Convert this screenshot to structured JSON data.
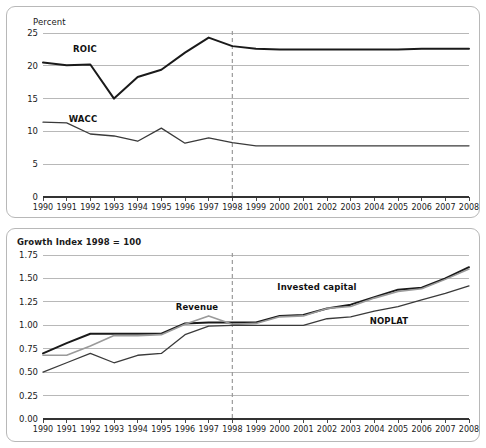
{
  "chart_data": [
    {
      "type": "line",
      "title": "",
      "ylabel": "Percent",
      "xlabel": "",
      "ylim": [
        0,
        25
      ],
      "yticks": [
        "0",
        "5",
        "10",
        "15",
        "20",
        "25"
      ],
      "grid": true,
      "legend_position": "inline-labels",
      "x": [
        "1990",
        "1991",
        "1992",
        "1993",
        "1994",
        "1995",
        "1996",
        "1997",
        "1998",
        "1999",
        "2000",
        "2001",
        "2002",
        "2003",
        "2004",
        "2005",
        "2006",
        "2007",
        "2008"
      ],
      "annotations": [
        {
          "text": "forecast-divider",
          "x": "1998",
          "style": "dashed-vertical"
        }
      ],
      "series": [
        {
          "name": "ROIC",
          "color": "#1a1a1a",
          "width": 2.0,
          "values": [
            20.5,
            20.1,
            20.2,
            15.0,
            18.3,
            19.4,
            22.0,
            24.3,
            23.0,
            22.6,
            22.5,
            22.5,
            22.5,
            22.5,
            22.5,
            22.5,
            22.6,
            22.6,
            22.6
          ]
        },
        {
          "name": "WACC",
          "color": "#3a3a3a",
          "width": 1.3,
          "values": [
            11.4,
            11.3,
            9.6,
            9.3,
            8.5,
            10.5,
            8.2,
            9.0,
            8.3,
            7.8,
            7.8,
            7.8,
            7.8,
            7.8,
            7.8,
            7.8,
            7.8,
            7.8,
            7.8
          ]
        }
      ]
    },
    {
      "type": "line",
      "title": "Growth Index 1998 = 100",
      "ylabel": "",
      "xlabel": "",
      "ylim": [
        0,
        1.75
      ],
      "yticks": [
        "0.00",
        "0.25",
        "0.50",
        "0.75",
        "1.00",
        "1.25",
        "1.50",
        "1.75"
      ],
      "grid": true,
      "legend_position": "inline-labels",
      "x": [
        "1990",
        "1991",
        "1992",
        "1993",
        "1994",
        "1995",
        "1996",
        "1997",
        "1998",
        "1999",
        "2000",
        "2001",
        "2002",
        "2003",
        "2004",
        "2005",
        "2006",
        "2007",
        "2008"
      ],
      "annotations": [
        {
          "text": "forecast-divider",
          "x": "1998",
          "style": "dashed-vertical"
        }
      ],
      "series": [
        {
          "name": "Invested capital",
          "color": "#1a1a1a",
          "width": 2.0,
          "values": [
            0.7,
            0.81,
            0.91,
            0.91,
            0.91,
            0.91,
            1.02,
            1.03,
            1.03,
            1.03,
            1.1,
            1.11,
            1.18,
            1.22,
            1.3,
            1.38,
            1.4,
            1.5,
            1.62
          ]
        },
        {
          "name": "Revenue",
          "color": "#9a9a9a",
          "width": 1.6,
          "values": [
            0.68,
            0.68,
            0.78,
            0.89,
            0.89,
            0.9,
            1.01,
            1.1,
            1.01,
            1.02,
            1.09,
            1.1,
            1.18,
            1.2,
            1.29,
            1.36,
            1.39,
            1.49,
            1.6
          ]
        },
        {
          "name": "NOPLAT",
          "color": "#3a3a3a",
          "width": 1.3,
          "values": [
            0.5,
            0.6,
            0.7,
            0.6,
            0.68,
            0.7,
            0.9,
            0.99,
            1.0,
            1.0,
            1.0,
            1.0,
            1.07,
            1.09,
            1.15,
            1.2,
            1.27,
            1.34,
            1.42
          ]
        }
      ]
    }
  ],
  "panels": {
    "top": {
      "axis_title": "Percent",
      "yticks": [
        "25",
        "20",
        "15",
        "10",
        "5",
        "0"
      ],
      "xticks": [
        "1990",
        "1991",
        "1992",
        "1993",
        "1994",
        "1995",
        "1996",
        "1997",
        "1998",
        "1999",
        "2000",
        "2001",
        "2002",
        "2003",
        "2004",
        "2005",
        "2006",
        "2007",
        "2008"
      ],
      "labels": [
        {
          "name": "roic",
          "text": "ROIC"
        },
        {
          "name": "wacc",
          "text": "WACC"
        }
      ]
    },
    "bottom": {
      "axis_title": "Growth Index 1998 = 100",
      "yticks": [
        "1.75",
        "1.50",
        "1.25",
        "1.00",
        "0.75",
        "0.50",
        "0.25",
        "0.00"
      ],
      "xticks": [
        "1990",
        "1991",
        "1992",
        "1993",
        "1994",
        "1995",
        "1996",
        "1997",
        "1998",
        "1999",
        "2000",
        "2001",
        "2002",
        "2003",
        "2004",
        "2005",
        "2006",
        "2007",
        "2008"
      ],
      "labels": [
        {
          "name": "revenue",
          "text": "Revenue"
        },
        {
          "name": "invested-capital",
          "text": "Invested capital"
        },
        {
          "name": "noplat",
          "text": "NOPLAT"
        }
      ]
    }
  },
  "colors": {
    "grid": "#b0b0b0",
    "axis": "#333333",
    "dark_series": "#1a1a1a",
    "mid_series": "#3a3a3a",
    "light_series": "#9a9a9a",
    "panel_border": "#b8b8b8",
    "text": "#1a1a1a"
  }
}
